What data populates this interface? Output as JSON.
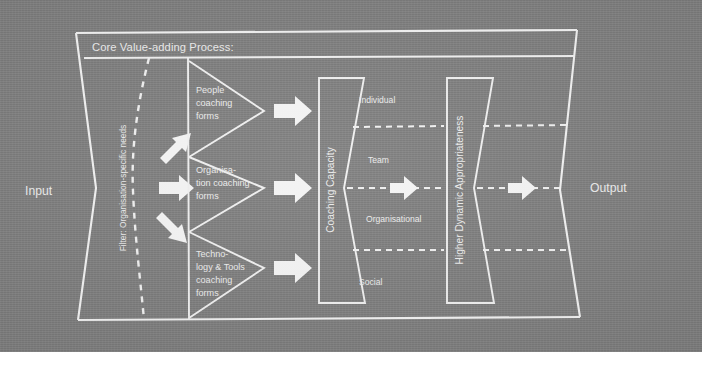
{
  "figure": {
    "background_color": "#808080",
    "line_color": "#f0f0f0",
    "header_label": "Core Value-adding Process:",
    "input_label": "Input",
    "output_label": "Output",
    "filter_label": "Filter: Organisation-specific needs"
  },
  "funnels": [
    {
      "name": "people",
      "lines": [
        "People",
        "coaching",
        "forms"
      ]
    },
    {
      "name": "organisation",
      "lines": [
        "Organisa-",
        "tion coaching",
        "forms"
      ]
    },
    {
      "name": "technology",
      "lines": [
        "Techno-",
        "logy & Tools",
        "coaching",
        "forms"
      ]
    }
  ],
  "capacity_block": {
    "label": "Coaching Capacity"
  },
  "appropriateness_block": {
    "label": "Higher Dynamic Appropriateness"
  },
  "levels": [
    {
      "name": "individual",
      "label": "Individual"
    },
    {
      "name": "team",
      "label": "Team"
    },
    {
      "name": "organisational",
      "label": "Organisational"
    },
    {
      "name": "social",
      "label": "Social"
    }
  ],
  "icons": {
    "arrow_up_right": "arrow-up-right-icon",
    "arrow_right": "arrow-right-icon",
    "arrow_down_right": "arrow-down-right-icon"
  }
}
